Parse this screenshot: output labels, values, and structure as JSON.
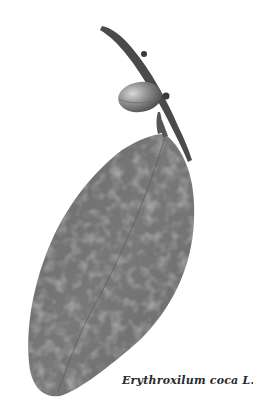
{
  "illustration": {
    "subject": "coca plant sprig with leaf and fruit",
    "caption": "Erythroxilum coca L."
  },
  "colors": {
    "background": "#ffffff",
    "leaf": "#6e6e6e",
    "leaf_light": "#8a8a8a",
    "stem": "#4a4a4a",
    "fruit": "#8c8c8c"
  }
}
